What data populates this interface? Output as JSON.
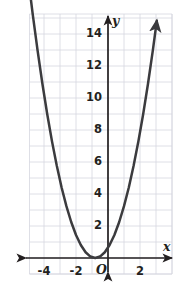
{
  "chart_data": {
    "type": "line",
    "title": "",
    "subtitle": "",
    "xlabel": "x",
    "ylabel": "y",
    "origin_label": "O",
    "xlim": [
      -5.0,
      4.0
    ],
    "ylim": [
      -0.9,
      16.4
    ],
    "grid": true,
    "grid_step_x": 1,
    "grid_step_y": 1,
    "legend": "none",
    "x_tick_labels": [
      "-4",
      "-2",
      "2"
    ],
    "x_tick_values": [
      -4,
      -2,
      2
    ],
    "y_tick_labels": [
      "2",
      "4",
      "6",
      "8",
      "10",
      "12",
      "14"
    ],
    "y_tick_values": [
      2,
      4,
      6,
      8,
      10,
      12,
      14
    ],
    "series": [
      {
        "name": "parabola",
        "equation": "y = (x + 0.8)^2",
        "vertex": [
          -0.8,
          0
        ],
        "color": "#3b3b3e",
        "arrow_start": true,
        "arrow_end": true,
        "x": [
          -4.95,
          -4.7,
          -4.4,
          -4.1,
          -3.8,
          -3.5,
          -3.2,
          -2.9,
          -2.6,
          -2.3,
          -2.0,
          -1.7,
          -1.4,
          -1.1,
          -0.8,
          -0.5,
          -0.2,
          0.1,
          0.4,
          0.7,
          1.0,
          1.3,
          1.6,
          1.9,
          2.2,
          2.5,
          2.8,
          3.05
        ],
        "y": [
          17.2,
          15.2,
          12.96,
          10.89,
          9.0,
          7.29,
          5.76,
          4.41,
          3.24,
          2.25,
          1.44,
          0.81,
          0.36,
          0.09,
          0.0,
          0.09,
          0.36,
          0.81,
          1.44,
          2.25,
          3.24,
          4.41,
          5.76,
          7.29,
          9.0,
          10.89,
          12.96,
          14.82
        ]
      }
    ],
    "axis_colors": {
      "axis": "#231f20",
      "grid": "#d5d7e0",
      "curve": "#3b3b3e"
    }
  }
}
